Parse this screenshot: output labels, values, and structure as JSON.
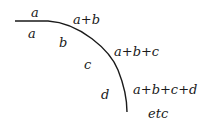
{
  "diagram": {
    "type": "cumulative-sum-curve",
    "stroke_color": "#1a1a1a",
    "segment_labels": [
      {
        "text": "a",
        "x": 32,
        "y": 38
      },
      {
        "text": "b",
        "x": 62,
        "y": 47
      },
      {
        "text": "c",
        "x": 87,
        "y": 69
      },
      {
        "text": "d",
        "x": 104,
        "y": 99
      }
    ],
    "cumulative_labels": [
      {
        "text": "a",
        "x": 33,
        "y": 17
      },
      {
        "text": "a+b",
        "x": 73,
        "y": 24
      },
      {
        "text": "a+b+c",
        "x": 114,
        "y": 56
      },
      {
        "text": "a+b+c+d",
        "x": 133,
        "y": 94
      },
      {
        "text": "etc",
        "x": 148,
        "y": 118
      }
    ]
  }
}
